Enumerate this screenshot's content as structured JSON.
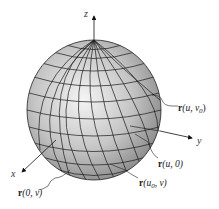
{
  "figure": {
    "type": "parametric-sphere",
    "axes": {
      "x": "x",
      "y": "y",
      "z": "z"
    },
    "labels": {
      "u_v0": {
        "vec": "r",
        "args": "(u, v",
        "sub": "0",
        "close": ")"
      },
      "u_0": {
        "vec": "r",
        "args": "(u, 0)"
      },
      "u0_v": {
        "vec": "r",
        "args": "(u",
        "sub": "0",
        "rest": ", v)"
      },
      "zero_v": {
        "vec": "r",
        "args": "(0, v)"
      }
    },
    "colors": {
      "sphere_light": "#f2f2f2",
      "sphere_dark": "#8a8a8a",
      "grid": "#1a1a1a"
    }
  }
}
